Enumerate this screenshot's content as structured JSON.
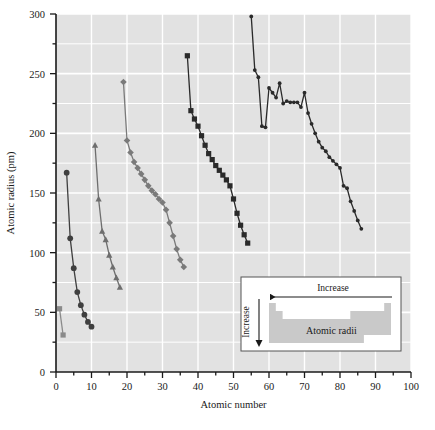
{
  "chart_data": {
    "type": "line",
    "title": "",
    "xlabel": "Atomic number",
    "ylabel": "Atomic radius (pm)",
    "xlim": [
      0,
      100
    ],
    "ylim": [
      0,
      300
    ],
    "xticks": [
      0,
      10,
      20,
      30,
      40,
      50,
      60,
      70,
      80,
      90,
      100
    ],
    "yticks": [
      0,
      50,
      100,
      150,
      200,
      250,
      300
    ],
    "xminorstep": 5,
    "yminorstep": 25,
    "grid": true,
    "gridcolor": "#ffffff",
    "plot_bgcolor": "#e2e2e2",
    "legend": "none",
    "series": [
      {
        "name": "Period 1",
        "marker": "square",
        "color": "#8a8a8a",
        "x": [
          1,
          2
        ],
        "y": [
          53,
          31
        ]
      },
      {
        "name": "Period 2",
        "marker": "circle",
        "color": "#3f3f3f",
        "x": [
          3,
          4,
          5,
          6,
          7,
          8,
          9,
          10
        ],
        "y": [
          167,
          112,
          87,
          67,
          56,
          48,
          42,
          38
        ]
      },
      {
        "name": "Period 3",
        "marker": "triangle",
        "color": "#6e6e6e",
        "x": [
          11,
          12,
          13,
          14,
          15,
          16,
          17,
          18
        ],
        "y": [
          190,
          145,
          118,
          111,
          98,
          88,
          79,
          71
        ]
      },
      {
        "name": "Period 4",
        "marker": "diamond",
        "color": "#7a7a7a",
        "x": [
          19,
          20,
          21,
          22,
          23,
          24,
          25,
          26,
          27,
          28,
          29,
          30,
          31,
          32,
          33,
          34,
          35,
          36
        ],
        "y": [
          243,
          194,
          184,
          176,
          171,
          166,
          161,
          156,
          152,
          149,
          145,
          142,
          136,
          125,
          114,
          103,
          94,
          88
        ]
      },
      {
        "name": "Period 5",
        "marker": "square",
        "color": "#2a2a2a",
        "x": [
          37,
          38,
          39,
          40,
          41,
          42,
          43,
          44,
          45,
          46,
          47,
          48,
          49,
          50,
          51,
          52,
          53,
          54
        ],
        "y": [
          265,
          219,
          212,
          206,
          198,
          190,
          183,
          178,
          173,
          169,
          165,
          161,
          156,
          145,
          133,
          123,
          115,
          108
        ]
      },
      {
        "name": "Period 6",
        "marker": "circle-small",
        "color": "#2a2a2a",
        "x": [
          55,
          56,
          57,
          58,
          59,
          60,
          61,
          62,
          63,
          64,
          65,
          66,
          67,
          68,
          69,
          70,
          71,
          72,
          73,
          74,
          75,
          76,
          77,
          78,
          79,
          80,
          81,
          82,
          83,
          84,
          85,
          86
        ],
        "y": [
          298,
          253,
          247,
          206,
          205,
          238,
          234,
          230,
          242,
          225,
          227,
          226,
          226,
          226,
          222,
          234,
          217,
          208,
          200,
          193,
          188,
          185,
          180,
          177,
          174,
          171,
          156,
          154,
          143,
          135,
          127,
          120
        ]
      }
    ],
    "inset": {
      "label": "Atomic radii",
      "horizontal_arrow_label": "Increase",
      "vertical_arrow_label": "Increase",
      "horizontal_arrow_direction": "left",
      "vertical_arrow_direction": "down",
      "table_fill": "#c9c9c9",
      "background": "#ffffff"
    }
  }
}
